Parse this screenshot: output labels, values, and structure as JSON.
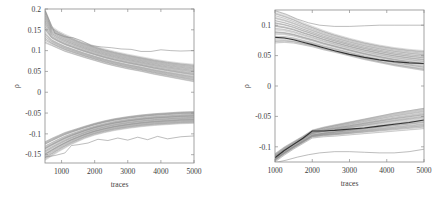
{
  "figure": {
    "background": "#ffffff",
    "panel_count": 2
  },
  "chart_data": [
    {
      "id": "left",
      "type": "line",
      "title": "",
      "xlabel": "traces",
      "ylabel": "ρ",
      "xlim": [
        500,
        5000
      ],
      "ylim": [
        -0.17,
        0.2
      ],
      "xticks": [
        1000,
        2000,
        3000,
        4000,
        5000
      ],
      "xticklabels": [
        "1000",
        "2000",
        "3000",
        "4000",
        "5000"
      ],
      "yticks": [
        0.2,
        0.15,
        0.1,
        0.05,
        0,
        -0.05,
        -0.1,
        -0.15
      ],
      "yticklabels": [
        "0.2",
        "0.15",
        "0.1",
        "0.05",
        "0",
        "-0.05",
        "-0.1",
        "-0.15"
      ],
      "grid": false,
      "legend": null,
      "plot_box": {
        "x": 45,
        "y": 9,
        "width": 149,
        "height": 154
      },
      "series": [
        {
          "name": "upper-band-top",
          "role": "envelope",
          "x": [
            500,
            700,
            900,
            1100,
            1300,
            1500,
            1700,
            2000,
            2300,
            2600,
            3000,
            3400,
            3800,
            4200,
            4600,
            5000
          ],
          "values": [
            0.2,
            0.158,
            0.147,
            0.139,
            0.132,
            0.125,
            0.119,
            0.111,
            0.104,
            0.098,
            0.091,
            0.085,
            0.079,
            0.074,
            0.07,
            0.067
          ]
        },
        {
          "name": "upper-band-bottom",
          "role": "envelope",
          "x": [
            500,
            700,
            900,
            1100,
            1300,
            1500,
            1700,
            2000,
            2300,
            2600,
            3000,
            3400,
            3800,
            4200,
            4600,
            5000
          ],
          "values": [
            0.118,
            0.112,
            0.105,
            0.098,
            0.093,
            0.088,
            0.083,
            0.076,
            0.069,
            0.063,
            0.056,
            0.05,
            0.043,
            0.037,
            0.031,
            0.025
          ]
        },
        {
          "name": "lower-band-top",
          "role": "envelope",
          "x": [
            500,
            700,
            900,
            1100,
            1300,
            1500,
            1700,
            2000,
            2300,
            2600,
            3000,
            3400,
            3800,
            4200,
            4600,
            5000
          ],
          "values": [
            -0.118,
            -0.11,
            -0.103,
            -0.096,
            -0.091,
            -0.086,
            -0.081,
            -0.074,
            -0.068,
            -0.063,
            -0.058,
            -0.054,
            -0.051,
            -0.049,
            -0.047,
            -0.046
          ]
        },
        {
          "name": "lower-band-bottom",
          "role": "envelope",
          "x": [
            500,
            700,
            900,
            1100,
            1300,
            1500,
            1700,
            2000,
            2300,
            2600,
            3000,
            3400,
            3800,
            4200,
            4600,
            5000
          ],
          "values": [
            -0.162,
            -0.152,
            -0.142,
            -0.133,
            -0.124,
            -0.117,
            -0.11,
            -0.102,
            -0.096,
            -0.091,
            -0.086,
            -0.082,
            -0.079,
            -0.077,
            -0.075,
            -0.074
          ]
        },
        {
          "name": "upper-outlier",
          "role": "outlier",
          "x": [
            500,
            800,
            1100,
            1350,
            1600,
            1900,
            2200,
            2500,
            2800,
            3100,
            3400,
            3700,
            4000,
            4300,
            4600,
            5000
          ],
          "values": [
            0.197,
            0.142,
            0.133,
            0.131,
            0.124,
            0.112,
            0.109,
            0.107,
            0.104,
            0.103,
            0.098,
            0.098,
            0.102,
            0.1,
            0.099,
            0.1
          ]
        },
        {
          "name": "lower-outlier",
          "role": "outlier",
          "x": [
            500,
            800,
            1100,
            1300,
            1500,
            1800,
            2100,
            2400,
            2700,
            3000,
            3300,
            3600,
            3900,
            4200,
            4600,
            5000
          ],
          "values": [
            -0.156,
            -0.152,
            -0.146,
            -0.128,
            -0.126,
            -0.122,
            -0.113,
            -0.116,
            -0.11,
            -0.115,
            -0.108,
            -0.114,
            -0.106,
            -0.112,
            -0.107,
            -0.105
          ]
        }
      ]
    },
    {
      "id": "right",
      "type": "line",
      "title": "",
      "xlabel": "traces",
      "ylabel": "ρ",
      "xlim": [
        1000,
        5000
      ],
      "ylim": [
        -0.125,
        0.125
      ],
      "xticks": [
        1000,
        2000,
        3000,
        4000,
        5000
      ],
      "xticklabels": [
        "1000",
        "2000",
        "3000",
        "4000",
        "5000"
      ],
      "yticks": [
        0.1,
        0.05,
        0,
        -0.05,
        -0.1
      ],
      "yticklabels": [
        "0.1",
        "0.05",
        "0",
        "-0.05",
        "-0.1"
      ],
      "grid": false,
      "legend": null,
      "plot_box": {
        "x": 275,
        "y": 10,
        "width": 149,
        "height": 152
      },
      "series": [
        {
          "name": "upper-band-top",
          "role": "envelope",
          "x": [
            1000,
            1250,
            1500,
            1750,
            2000,
            2300,
            2600,
            3000,
            3400,
            3800,
            4200,
            4600,
            5000
          ],
          "values": [
            0.122,
            0.117,
            0.111,
            0.104,
            0.098,
            0.091,
            0.085,
            0.078,
            0.072,
            0.067,
            0.063,
            0.06,
            0.058
          ]
        },
        {
          "name": "upper-band-bottom",
          "role": "envelope",
          "x": [
            1000,
            1250,
            1500,
            1750,
            2000,
            2300,
            2600,
            3000,
            3400,
            3800,
            4200,
            4600,
            5000
          ],
          "values": [
            0.07,
            0.071,
            0.07,
            0.067,
            0.064,
            0.059,
            0.055,
            0.049,
            0.043,
            0.038,
            0.033,
            0.029,
            0.025
          ]
        },
        {
          "name": "upper-mean",
          "role": "mean",
          "x": [
            1000,
            1250,
            1500,
            1750,
            2000,
            2300,
            2600,
            3000,
            3400,
            3800,
            4200,
            4600,
            5000
          ],
          "values": [
            0.08,
            0.079,
            0.076,
            0.072,
            0.068,
            0.063,
            0.058,
            0.052,
            0.047,
            0.043,
            0.04,
            0.038,
            0.037
          ]
        },
        {
          "name": "lower-band-top",
          "role": "envelope",
          "x": [
            1000,
            1250,
            1500,
            1750,
            2000,
            2300,
            2600,
            3000,
            3400,
            3800,
            4200,
            4600,
            5000
          ],
          "values": [
            -0.112,
            -0.101,
            -0.092,
            -0.083,
            -0.073,
            -0.068,
            -0.064,
            -0.059,
            -0.054,
            -0.049,
            -0.044,
            -0.04,
            -0.036
          ]
        },
        {
          "name": "lower-band-bottom",
          "role": "envelope",
          "x": [
            1000,
            1250,
            1500,
            1750,
            2000,
            2300,
            2600,
            3000,
            3400,
            3800,
            4200,
            4600,
            5000
          ],
          "values": [
            -0.124,
            -0.113,
            -0.103,
            -0.094,
            -0.085,
            -0.083,
            -0.082,
            -0.08,
            -0.078,
            -0.076,
            -0.074,
            -0.072,
            -0.07
          ]
        },
        {
          "name": "lower-mean",
          "role": "mean",
          "x": [
            1000,
            1250,
            1500,
            1750,
            2000,
            2300,
            2600,
            3000,
            3400,
            3800,
            4200,
            4600,
            5000
          ],
          "values": [
            -0.118,
            -0.106,
            -0.096,
            -0.086,
            -0.074,
            -0.074,
            -0.073,
            -0.071,
            -0.069,
            -0.066,
            -0.063,
            -0.06,
            -0.056
          ]
        },
        {
          "name": "upper-outlier",
          "role": "outlier",
          "x": [
            1000,
            1300,
            1600,
            1900,
            2200,
            2600,
            3000,
            3400,
            3800,
            4200,
            4600,
            5000
          ],
          "values": [
            0.124,
            0.118,
            0.11,
            0.104,
            0.1,
            0.098,
            0.098,
            0.099,
            0.1,
            0.1,
            0.1,
            0.1
          ]
        },
        {
          "name": "lower-outlier",
          "role": "outlier",
          "x": [
            1000,
            1300,
            1600,
            1900,
            2200,
            2600,
            3000,
            3400,
            3800,
            4200,
            4600,
            5000
          ],
          "values": [
            -0.126,
            -0.122,
            -0.117,
            -0.113,
            -0.11,
            -0.108,
            -0.108,
            -0.109,
            -0.11,
            -0.11,
            -0.108,
            -0.104
          ]
        }
      ]
    }
  ]
}
